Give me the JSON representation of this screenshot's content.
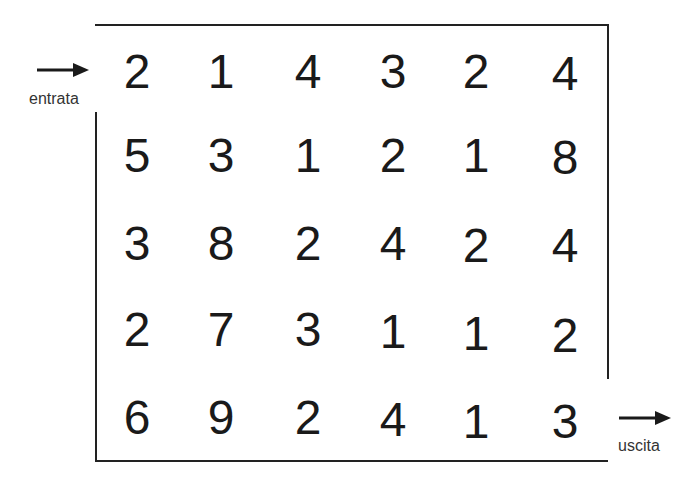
{
  "maze": {
    "grid": [
      [
        "2",
        "1",
        "4",
        "3",
        "2",
        "4"
      ],
      [
        "5",
        "3",
        "1",
        "2",
        "1",
        "8"
      ],
      [
        "3",
        "8",
        "2",
        "4",
        "2",
        "4"
      ],
      [
        "2",
        "7",
        "3",
        "1",
        "1",
        "2"
      ],
      [
        "6",
        "9",
        "2",
        "4",
        "1",
        "3"
      ]
    ],
    "entrance_label": "entrata",
    "exit_label": "uscita"
  }
}
